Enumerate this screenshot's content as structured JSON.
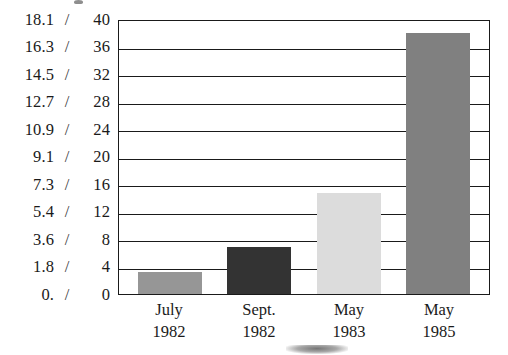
{
  "chart_data": {
    "type": "bar",
    "title": "",
    "subtitle": "",
    "xlabel": "",
    "ylabel": "",
    "categories": [
      "July 1982",
      "Sept. 1982",
      "May 1983",
      "May 1985"
    ],
    "category_lines": [
      [
        "July",
        "1982"
      ],
      [
        "Sept.",
        "1982"
      ],
      [
        "May",
        "1983"
      ],
      [
        "May",
        "1985"
      ]
    ],
    "values": [
      3.2,
      6.9,
      14.7,
      38.0
    ],
    "bar_colors": [
      "#969696",
      "#333333",
      "#dcdcdc",
      "#808080"
    ],
    "ylim": [
      0,
      40
    ],
    "yticks": [
      0,
      4,
      8,
      12,
      16,
      20,
      24,
      28,
      32,
      36,
      40
    ],
    "ytick_labels": [
      "0",
      "4",
      "8",
      "12",
      "16",
      "20",
      "24",
      "28",
      "32",
      "36",
      "40"
    ],
    "secondary_axis": {
      "ylim": [
        0,
        18.1
      ],
      "ticks": [
        0,
        1.8,
        3.6,
        5.4,
        7.3,
        9.1,
        10.9,
        12.7,
        14.5,
        16.3,
        18.1
      ],
      "tick_labels": [
        "0.",
        "1.8",
        "3.6",
        "5.4",
        "7.3",
        "9.1",
        "10.9",
        "12.7",
        "14.5",
        "16.3",
        "18.1"
      ],
      "separator": "/"
    },
    "grid": true,
    "grid_axis": "y",
    "legend": false,
    "legend_position": "none"
  },
  "axis_rows": [
    {
      "secondary": "18.1",
      "slash": "/",
      "primary": "40"
    },
    {
      "secondary": "16.3",
      "slash": "/",
      "primary": "36"
    },
    {
      "secondary": "14.5",
      "slash": "/",
      "primary": "32"
    },
    {
      "secondary": "12.7",
      "slash": "/",
      "primary": "28"
    },
    {
      "secondary": "10.9",
      "slash": "/",
      "primary": "24"
    },
    {
      "secondary": "9.1",
      "slash": "/",
      "primary": "20"
    },
    {
      "secondary": "7.3",
      "slash": "/",
      "primary": "16"
    },
    {
      "secondary": "5.4",
      "slash": "/",
      "primary": "12"
    },
    {
      "secondary": "3.6",
      "slash": "/",
      "primary": "8"
    },
    {
      "secondary": "1.8",
      "slash": "/",
      "primary": "4"
    },
    {
      "secondary": "0.",
      "slash": "/",
      "primary": "0"
    }
  ]
}
